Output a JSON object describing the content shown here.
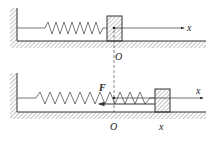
{
  "diagram": {
    "top_panel": {
      "origin_label": "O",
      "axis_label": "x"
    },
    "bottom_panel": {
      "force_label": "F",
      "origin_label": "O",
      "axis_label": "x",
      "displacement_label": "x"
    },
    "colors": {
      "line": "#333333",
      "hatch": "#888888",
      "background": "#ffffff"
    }
  }
}
